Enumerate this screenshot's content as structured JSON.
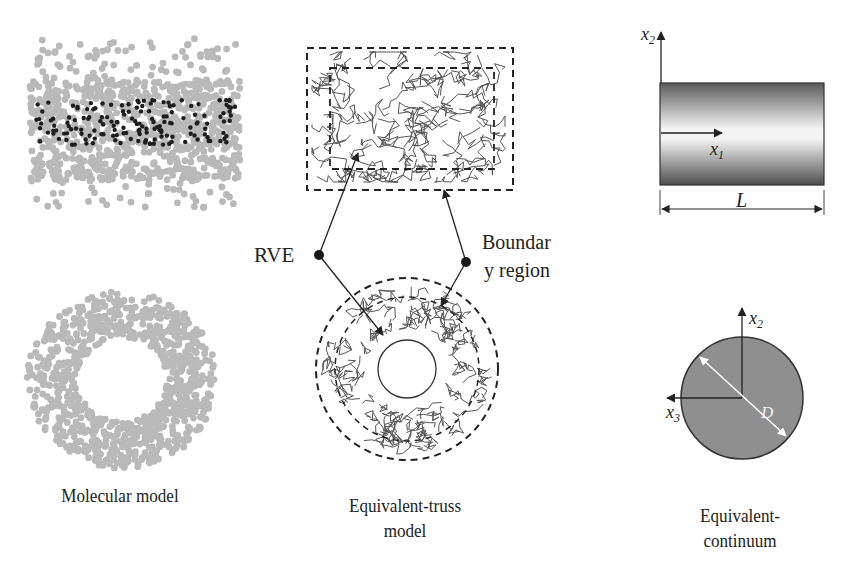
{
  "figure": {
    "panels": {
      "molecular": {
        "caption": "Molecular model"
      },
      "truss": {
        "caption_line1": "Equivalent-truss",
        "caption_line2": "model"
      },
      "continuum": {
        "caption_line1": "Equivalent-",
        "caption_line2": "continuum"
      }
    },
    "annotations": {
      "rve": "RVE",
      "boundary_line1": "Boundar",
      "boundary_line2": "y region"
    },
    "axes": {
      "side_view": {
        "vertical": "x",
        "vertical_sub": "2",
        "horizontal": "x",
        "horizontal_sub": "1",
        "length": "L"
      },
      "cross_section": {
        "vertical": "x",
        "vertical_sub": "2",
        "horizontal": "x",
        "horizontal_sub": "3",
        "diameter": "D"
      }
    },
    "colors": {
      "particle": "#b9b9b9",
      "particle_dark": "#1e1e1e",
      "truss": "#555555",
      "line": "#222222",
      "disk": "#8f8f8f"
    }
  }
}
